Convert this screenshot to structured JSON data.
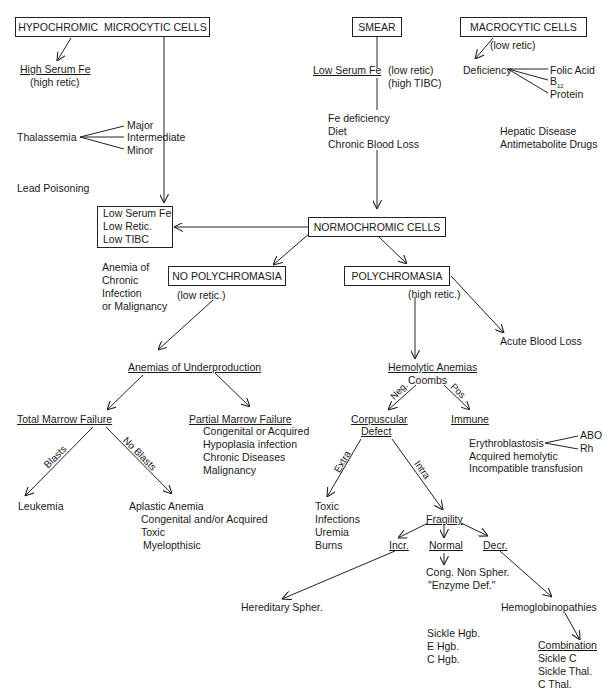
{
  "boxes": {
    "hypochromic": "HYPOCHROMIC  MICROCYTIC CELLS",
    "smear": "SMEAR",
    "macrocytic": "MACROCYTIC CELLS",
    "normochromic": "NORMOCHROMIC CELLS",
    "no_polychromasia": "NO POLYCHROMASIA",
    "polychromasia": "POLYCHROMASIA",
    "low_serum_box": [
      "Low Serum Fe",
      "Low Retic.",
      "Low TIBC"
    ]
  },
  "hypochromic_branch": {
    "high_serum_fe": "High Serum Fe",
    "high_retic": "(high retic)",
    "thalassemia": "Thalassemia",
    "thalassemia_types": [
      "Major",
      "Intermediate",
      "Minor"
    ],
    "lead_poisoning": "Lead Poisoning"
  },
  "smear_branch": {
    "low_serum_fe": "Low Serum Fe",
    "low_retic": "(low retic)",
    "high_tibc": "(high TIBC)",
    "causes": [
      "Fe deficiency",
      "Diet",
      "Chronic Blood Loss"
    ]
  },
  "macrocytic_branch": {
    "low_retic": "(low retic)",
    "deficiency": "Deficiency",
    "deficiency_types": [
      "Folic Acid",
      "B",
      "Protein"
    ],
    "b_subscript": "12",
    "other": [
      "Hepatic Disease",
      "Antimetabolite Drugs"
    ]
  },
  "chronic_anemia": [
    "Anemia of",
    "Chronic",
    "Infection",
    "or Malignancy"
  ],
  "no_poly_branch": {
    "low_retic": "(low retic.)",
    "underproduction": "Anemias of Underproduction",
    "total_marrow": "Total Marrow Failure",
    "partial_marrow": "Partial Marrow Failure",
    "partial_causes": [
      "Congenital or Acquired",
      "Hypoplasia infection",
      "Chronic Diseases",
      "Malignancy"
    ],
    "blasts_label": "Blasts",
    "no_blasts_label": "No Blasts",
    "leukemia": "Leukemia",
    "aplastic": "Aplastic Anemia",
    "aplastic_causes": [
      "Congenital and/or Acquired",
      "Toxic",
      "Myelopthisic"
    ]
  },
  "poly_branch": {
    "high_retic": "(high retic.)",
    "acute_blood_loss": "Acute Blood Loss",
    "hemolytic": "Hemolytic Anemias",
    "coombs": "Coombs",
    "neg_label": "Neg.",
    "pos_label": "Pos",
    "corpuscular": [
      "Corpuscular",
      "Defect"
    ],
    "immune": "Immune",
    "erythroblastosis": "Erythroblastosis",
    "erythro_types": [
      "ABO",
      "Rh"
    ],
    "immune_causes": [
      "Acquired hemolytic",
      "Incompatible transfusion"
    ],
    "extra_label": "Extra",
    "intra_label": "Intra",
    "extra_causes": [
      "Toxic",
      "Infections",
      "Uremia",
      "Burns"
    ],
    "fragility": "Fragility",
    "incr": "Incr.",
    "normal": "Normal",
    "decr": "Decr.",
    "normal_result": [
      "Cong. Non Spher.",
      "\"Enzyme Def.\""
    ],
    "hereditary": "Hereditary Spher.",
    "hemoglobinopathies": "Hemoglobinopathies",
    "hgb_types": [
      "Sickle Hgb.",
      "E Hgb.",
      "C Hgb."
    ],
    "combination": "Combination",
    "combination_types": [
      "Sickle C",
      "Sickle Thal.",
      "C Thal."
    ]
  }
}
